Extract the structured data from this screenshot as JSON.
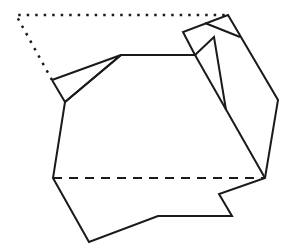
{
  "diagram": {
    "title": "",
    "stroke_color": "#1a1a1a",
    "background": "#ffffff",
    "solid_paths": [
      {
        "name": "main-outline",
        "points": [
          [
            65,
            102
          ],
          [
            53,
            178
          ],
          [
            89,
            242
          ],
          [
            158,
            216
          ],
          [
            232,
            216
          ],
          [
            219,
            194
          ],
          [
            265,
            178
          ],
          [
            278,
            100
          ],
          [
            228,
            15
          ],
          [
            183,
            32
          ],
          [
            195,
            55
          ],
          [
            121,
            55
          ],
          [
            65,
            102
          ]
        ]
      },
      {
        "name": "left-flap",
        "points": [
          [
            52,
            80
          ],
          [
            121,
            55
          ],
          [
            65,
            102
          ],
          [
            52,
            80
          ]
        ]
      },
      {
        "name": "top-fold-crease",
        "points": [
          [
            205,
            23
          ],
          [
            240,
            37
          ]
        ]
      },
      {
        "name": "inner-triangle",
        "points": [
          [
            195,
            55
          ],
          [
            214,
            37
          ],
          [
            226,
            110
          ]
        ]
      },
      {
        "name": "right-inner-edge",
        "points": [
          [
            195,
            55
          ],
          [
            265,
            178
          ]
        ]
      }
    ],
    "dotted_paths": [
      {
        "name": "unfolded-flap-outline",
        "points": [
          [
            52,
            80
          ],
          [
            16,
            15
          ],
          [
            228,
            15
          ]
        ]
      }
    ],
    "dashed_paths": [
      {
        "name": "fold-line",
        "points": [
          [
            53,
            178
          ],
          [
            265,
            178
          ]
        ]
      }
    ]
  }
}
